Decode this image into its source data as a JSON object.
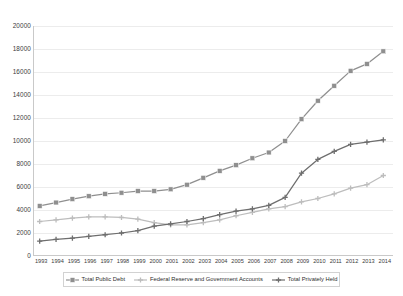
{
  "chart_data": {
    "type": "line",
    "title": "",
    "xlabel": "",
    "ylabel": "",
    "ylim": [
      0,
      20000
    ],
    "ytick_step": 2000,
    "yticks": [
      0,
      2000,
      4000,
      6000,
      8000,
      10000,
      12000,
      14000,
      16000,
      18000,
      20000
    ],
    "grid": true,
    "legend_position": "bottom",
    "categories": [
      "1993",
      "1994",
      "1995",
      "1996",
      "1997",
      "1998",
      "1999",
      "2000",
      "2001",
      "2002",
      "2003",
      "2004",
      "2005",
      "2006",
      "2007",
      "2008",
      "2009",
      "2010",
      "2011",
      "2012",
      "2013",
      "2014"
    ],
    "series": [
      {
        "name": "Total Public Debt",
        "color": "#8f8f8f",
        "marker": "square",
        "values": [
          4350,
          4650,
          4950,
          5200,
          5400,
          5500,
          5650,
          5650,
          5800,
          6200,
          6800,
          7400,
          7900,
          8500,
          9000,
          10000,
          11900,
          13500,
          14800,
          16100,
          16700,
          17800
        ]
      },
      {
        "name": "Federal Reserve and Government Accounts",
        "color": "#bdbdbd",
        "marker": "cross",
        "values": [
          3000,
          3150,
          3300,
          3400,
          3400,
          3350,
          3200,
          2900,
          2700,
          2700,
          2900,
          3150,
          3500,
          3800,
          4100,
          4300,
          4700,
          5000,
          5400,
          5900,
          6200,
          7000
        ]
      },
      {
        "name": "Total Privately Held",
        "color": "#6e6e6e",
        "marker": "cross",
        "values": [
          1300,
          1450,
          1550,
          1700,
          1850,
          2000,
          2200,
          2600,
          2800,
          3000,
          3250,
          3600,
          3900,
          4100,
          4400,
          5100,
          7200,
          8400,
          9100,
          9700,
          9900,
          10100
        ]
      }
    ]
  },
  "legend": {
    "items": [
      {
        "label": "Total Public Debt"
      },
      {
        "label": "Federal Reserve and Government Accounts"
      },
      {
        "label": "Total Privately Held"
      }
    ]
  }
}
